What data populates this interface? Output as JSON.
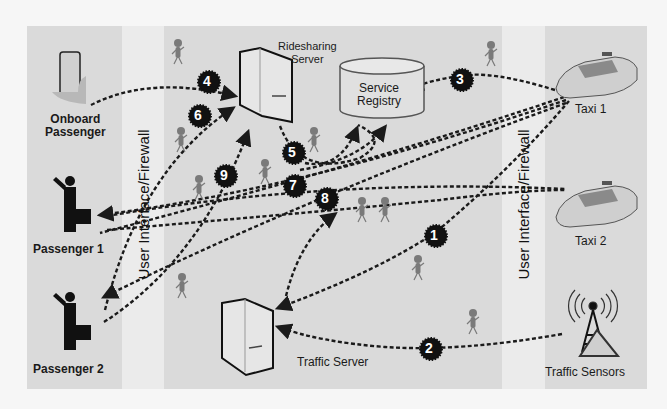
{
  "diagram": {
    "colors": {
      "background": "#dadada",
      "band": "#ebebeb",
      "arrow": "#1a1a1a",
      "badge": "#111111",
      "person": "#7a7a7a"
    },
    "bands": [
      {
        "label": "User Interface/Firewall"
      },
      {
        "label": "User Interface/Firewall"
      }
    ],
    "nodes": {
      "onboard_passenger": {
        "label_line1": "Onboard",
        "label_line2": "Passenger",
        "icon": "smartphone-icon"
      },
      "passenger_1": {
        "label": "Passenger 1",
        "icon": "passenger-icon"
      },
      "passenger_2": {
        "label": "Passenger 2",
        "icon": "passenger-icon"
      },
      "ridesharing_server": {
        "label_line1": "Ridesharing",
        "label_line2": "Server",
        "icon": "server-icon"
      },
      "service_registry": {
        "label_line1": "Service",
        "label_line2": "Registry",
        "icon": "database-icon"
      },
      "traffic_server": {
        "label": "Traffic Server",
        "icon": "server-icon"
      },
      "taxi_1": {
        "label": "Taxi 1",
        "icon": "taxi-icon"
      },
      "taxi_2": {
        "label": "Taxi 2",
        "icon": "taxi-icon"
      },
      "traffic_sensors": {
        "label": "Traffic Sensors",
        "icon": "antenna-icon"
      }
    },
    "steps": [
      {
        "n": "1",
        "from": "Taxi 1",
        "to": "Traffic Server"
      },
      {
        "n": "2",
        "from": "Traffic Sensors",
        "to": "Traffic Server"
      },
      {
        "n": "3",
        "from": "Taxi 1",
        "to": "Service Registry"
      },
      {
        "n": "4",
        "from": "Onboard Passenger",
        "to": "Ridesharing Server"
      },
      {
        "n": "5",
        "from": "Ridesharing Server",
        "to": "Service Registry"
      },
      {
        "n": "6",
        "from": "Passenger 2",
        "to": "Ridesharing Server"
      },
      {
        "n": "7",
        "from": "Taxi 1",
        "to": "Passenger 1"
      },
      {
        "n": "8",
        "from": "Traffic Server",
        "to": "Passenger 1 / Taxi 2"
      },
      {
        "n": "9",
        "from": "Passenger 2",
        "to": "Ridesharing Server"
      }
    ]
  }
}
